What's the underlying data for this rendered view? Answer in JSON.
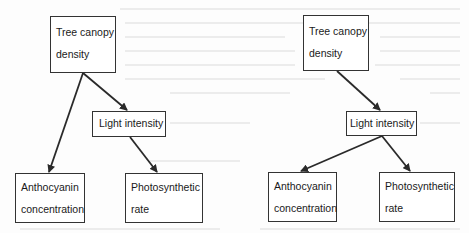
{
  "diagrams": [
    {
      "id": "left",
      "nodes": {
        "tree": {
          "line1": "Tree canopy",
          "line2": "density"
        },
        "light": {
          "label": "Light intensity"
        },
        "antho": {
          "line1": "Anthocyanin",
          "line2": "concentration"
        },
        "photo": {
          "line1": "Photosynthetic",
          "line2": "rate"
        }
      },
      "edges": [
        {
          "from": "Tree canopy density",
          "to": "Anthocyanin concentration"
        },
        {
          "from": "Tree canopy density",
          "to": "Light intensity"
        },
        {
          "from": "Light intensity",
          "to": "Photosynthetic rate"
        }
      ]
    },
    {
      "id": "right",
      "nodes": {
        "tree": {
          "line1": "Tree canopy",
          "line2": "density"
        },
        "light": {
          "label": "Light intensity"
        },
        "antho": {
          "line1": "Anthocyanin",
          "line2": "concentration"
        },
        "photo": {
          "line1": "Photosynthetic",
          "line2": "rate"
        }
      },
      "edges": [
        {
          "from": "Tree canopy density",
          "to": "Light intensity"
        },
        {
          "from": "Light intensity",
          "to": "Anthocyanin concentration"
        },
        {
          "from": "Light intensity",
          "to": "Photosynthetic rate"
        }
      ]
    }
  ],
  "colors": {
    "line": "#2a2a2a",
    "box_border": "#333333",
    "background": "#fdfdfd"
  }
}
